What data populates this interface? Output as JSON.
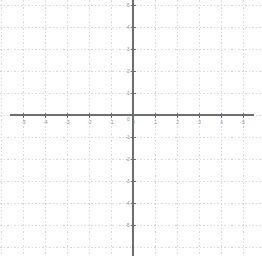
{
  "figure": {
    "kind": "cartesian-coordinate-grid",
    "width": 262,
    "height": 256,
    "background_color": "#ffffff",
    "title": "",
    "subtitle": ""
  },
  "style": {
    "grid_color": "#d9d9d9",
    "axis_color": "#6d6d6d",
    "tick_label_color": "#8a8a8a",
    "grid_dashed": true,
    "axis_stroke_width": 2,
    "grid_stroke_width": 1
  },
  "geometry": {
    "origin_x_px": 133,
    "origin_y_px": 115,
    "unit_px": 22,
    "x_axis_start_px": 10,
    "x_axis_end_px": 254,
    "y_axis_start_px": 0,
    "y_axis_end_px": 256
  },
  "chart_data": {
    "type": "scatter",
    "title": "",
    "xlabel": "",
    "ylabel": "",
    "xlim": [
      -5.6,
      5.6
    ],
    "ylim": [
      -5.2,
      5.2
    ],
    "grid": true,
    "legend": null,
    "series": [],
    "x_ticks": [
      -5,
      -4,
      -3,
      -2,
      -1,
      0,
      1,
      2,
      3,
      4,
      5
    ],
    "y_ticks": [
      5,
      4,
      3,
      2,
      1,
      0,
      -1,
      -2,
      -3,
      -4,
      -5
    ],
    "x_tick_labels": [
      "-5",
      "-4",
      "-3",
      "-2",
      "-1",
      "0",
      "1",
      "2",
      "3",
      "4",
      "5"
    ],
    "y_tick_labels": [
      "5",
      "4",
      "3",
      "2",
      "1",
      "0",
      "-1",
      "-2",
      "-3",
      "-4",
      "-5"
    ],
    "annotations": [],
    "data_points": []
  },
  "axes": {
    "x_axis_name": "x-axis",
    "y_axis_name": "y-axis"
  }
}
